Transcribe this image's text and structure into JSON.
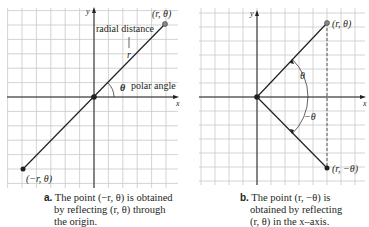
{
  "panels": [
    {
      "id": "a",
      "axis_x_label": "x",
      "axis_y_label": "y",
      "point_label": "(r, θ)",
      "reflected_point_label": "(−r, θ)",
      "radial_label": "radial distance",
      "r_label": "r",
      "theta_label": "θ",
      "polar_angle_label": "polar angle",
      "caption_letter": "a.",
      "caption_lines": [
        "The point (−r, θ) is obtained",
        "by reflecting (r, θ) through",
        "the origin."
      ]
    },
    {
      "id": "b",
      "axis_x_label": "x",
      "axis_y_label": "y",
      "point_label": "(r, θ)",
      "reflected_point_label": "(r, −θ)",
      "theta_label": "θ",
      "neg_theta_label": "−θ",
      "caption_letter": "b.",
      "caption_lines": [
        "The point (r, −θ) is",
        "obtained by reflecting",
        "(r, θ) in the x–axis."
      ]
    }
  ],
  "colors": {
    "grid": "#c8c8c8",
    "ink": "#231f20",
    "point_gray": "#888888"
  }
}
